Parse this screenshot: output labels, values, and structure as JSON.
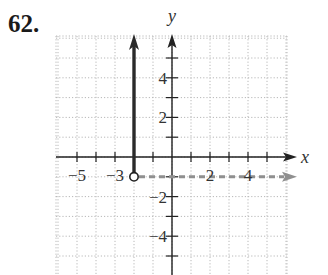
{
  "problem": {
    "number": "62."
  },
  "chart_data": {
    "type": "line",
    "title": "",
    "xlabel": "x",
    "ylabel": "y",
    "xlim": [
      -6,
      6
    ],
    "ylim": [
      -6,
      6
    ],
    "grid": true,
    "x_tick_labels": [
      {
        "value": -5,
        "label": "−5"
      },
      {
        "value": -3,
        "label": "−3"
      },
      {
        "value": 2,
        "label": "2"
      },
      {
        "value": 4,
        "label": "4"
      }
    ],
    "y_tick_labels": [
      {
        "value": 4,
        "label": "4"
      },
      {
        "value": 2,
        "label": "2"
      },
      {
        "value": -2,
        "label": "−2"
      },
      {
        "value": -4,
        "label": "−4"
      }
    ],
    "series": [
      {
        "name": "vertical ray x = -2",
        "style": "solid-bold",
        "color": "#2a2a2a",
        "points": [
          {
            "x": -2,
            "y": -1
          },
          {
            "x": -2,
            "y": 6
          }
        ],
        "end_arrow": "up"
      },
      {
        "name": "horizontal ray y = -1",
        "style": "dashed",
        "color": "#8f8f8f",
        "points": [
          {
            "x": -2,
            "y": -1
          },
          {
            "x": 6,
            "y": -1
          }
        ],
        "end_arrow": "right"
      }
    ],
    "annotations": [
      {
        "type": "open-circle",
        "x": -2,
        "y": -1
      }
    ]
  }
}
